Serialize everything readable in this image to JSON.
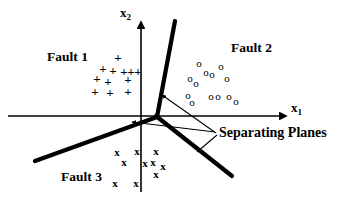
{
  "figure": {
    "title_text": "",
    "background": "#ffffff",
    "ink": "#000000"
  },
  "axes": {
    "x_axis": {
      "label": "x",
      "subscript": "1",
      "label_name": "x1-axis-label"
    },
    "y_axis": {
      "label": "x",
      "subscript": "2",
      "label_name": "x2-axis-label"
    }
  },
  "regions": [
    {
      "id": "fault1",
      "label": "Fault 1",
      "marker": "+"
    },
    {
      "id": "fault2",
      "label": "Fault 2",
      "marker": "o"
    },
    {
      "id": "fault3",
      "label": "Fault 3",
      "marker": "x"
    }
  ],
  "annotations": [
    {
      "id": "separating-planes",
      "label": "Separating Planes"
    }
  ],
  "chart_data": {
    "type": "scatter",
    "title": "",
    "xlabel": "x1",
    "ylabel": "x2",
    "grid": false,
    "legend": "inline-region-labels",
    "series": [
      {
        "name": "Fault 1",
        "marker": "+",
        "points": [
          [
            118,
            57
          ],
          [
            103,
            68
          ],
          [
            113,
            70
          ],
          [
            124,
            71
          ],
          [
            131,
            71
          ],
          [
            138,
            71
          ],
          [
            97,
            78
          ],
          [
            108,
            81
          ],
          [
            128,
            79
          ],
          [
            95,
            91
          ],
          [
            110,
            92
          ],
          [
            128,
            91
          ]
        ]
      },
      {
        "name": "Fault 2",
        "marker": "o",
        "points": [
          [
            199,
            63
          ],
          [
            221,
            66
          ],
          [
            206,
            72
          ],
          [
            212,
            74
          ],
          [
            190,
            78
          ],
          [
            227,
            78
          ],
          [
            196,
            83
          ],
          [
            188,
            95
          ],
          [
            211,
            96
          ],
          [
            218,
            96
          ],
          [
            229,
            96
          ],
          [
            192,
            102
          ],
          [
            236,
            101
          ]
        ]
      },
      {
        "name": "Fault 3",
        "marker": "x",
        "points": [
          [
            117,
            152
          ],
          [
            137,
            151
          ],
          [
            156,
            151
          ],
          [
            124,
            162
          ],
          [
            145,
            163
          ],
          [
            153,
            162
          ],
          [
            163,
            166
          ],
          [
            156,
            174
          ],
          [
            115,
            183
          ],
          [
            136,
            183
          ]
        ]
      }
    ],
    "separating_planes": [
      {
        "name": "plane-upper-right",
        "from": [
          157,
          116
        ],
        "to": [
          175,
          21
        ]
      },
      {
        "name": "plane-lower-right",
        "from": [
          157,
          116
        ],
        "to": [
          232,
          175
        ]
      },
      {
        "name": "plane-lower-left",
        "from": [
          157,
          116
        ],
        "to": [
          35,
          160
        ]
      }
    ],
    "axis_lines": [
      {
        "name": "x-axis",
        "from": [
          8,
          116
        ],
        "to": [
          290,
          116
        ],
        "arrow": "end"
      },
      {
        "name": "y-axis",
        "from": [
          141,
          192
        ],
        "to": [
          141,
          18
        ],
        "arrow": "end"
      }
    ],
    "leader_lines": [
      {
        "from": [
          218,
          134
        ],
        "to": [
          161,
          94
        ]
      },
      {
        "from": [
          218,
          134
        ],
        "to": [
          198,
          151
        ]
      },
      {
        "from": [
          218,
          134
        ],
        "to": [
          133,
          121
        ]
      }
    ]
  }
}
